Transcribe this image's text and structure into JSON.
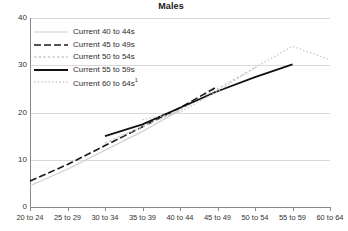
{
  "chart_data": {
    "type": "line",
    "title": "Males",
    "xlabel": "",
    "ylabel": "",
    "ylim": [
      0,
      40
    ],
    "yticks": [
      0,
      10,
      20,
      30,
      40
    ],
    "grid": true,
    "legend_position": "top-left inside plot",
    "categories": [
      "20 to 24",
      "25 to 29",
      "30 to 34",
      "35 to 39",
      "40 to 44",
      "45 to 49",
      "50 to 54",
      "55 to 59",
      "60 to 64"
    ],
    "series": [
      {
        "name": "Current 40 to 44s",
        "style": "solid",
        "color": "#cfcfcf",
        "width": 1.2,
        "x": [
          "20 to 24",
          "25 to 29",
          "30 to 34",
          "35 to 39",
          "40 to 44"
        ],
        "values": [
          4.5,
          8.0,
          12.0,
          16.0,
          20.5
        ]
      },
      {
        "name": "Current 45 to 49s",
        "style": "dashed",
        "color": "#1a1a1a",
        "width": 1.6,
        "x": [
          "20 to 24",
          "25 to 29",
          "30 to 34",
          "35 to 39",
          "40 to 44",
          "45 to 49"
        ],
        "values": [
          5.5,
          9.0,
          13.0,
          17.0,
          21.0,
          25.5
        ]
      },
      {
        "name": "Current 50 to 54s",
        "style": "dotted",
        "color": "#c9c9c9",
        "width": 1.4,
        "x": [
          "30 to 34",
          "35 to 39",
          "40 to 44",
          "45 to 49",
          "50 to 54"
        ],
        "values": [
          13.5,
          17.0,
          20.5,
          25.0,
          29.5
        ]
      },
      {
        "name": "Current 55 to 59s",
        "style": "solid",
        "color": "#111111",
        "width": 1.8,
        "x": [
          "30 to 34",
          "35 to 39",
          "40 to 44",
          "45 to 49",
          "50 to 54",
          "55 to 59"
        ],
        "values": [
          15.0,
          17.5,
          21.0,
          24.5,
          27.5,
          30.2
        ]
      },
      {
        "name": "Current 60 to 64s",
        "style": "fine-dotted",
        "color": "#c9c9c9",
        "width": 1.4,
        "x": [
          "35 to 39",
          "40 to 44",
          "45 to 49",
          "50 to 54",
          "55 to 59",
          "60 to 64"
        ],
        "values": [
          18.5,
          20.0,
          24.5,
          29.5,
          34.0,
          31.2
        ]
      }
    ]
  },
  "chart": {
    "title": "Males",
    "yticks": [
      {
        "label": "40",
        "value": 40
      },
      {
        "label": "30",
        "value": 30
      },
      {
        "label": "20",
        "value": 20
      },
      {
        "label": "10",
        "value": 10
      },
      {
        "label": "0",
        "value": 0
      }
    ],
    "xticks": [
      {
        "label": "20 to 24"
      },
      {
        "label": "25 to 29"
      },
      {
        "label": "30 to 34"
      },
      {
        "label": "35 to 39"
      },
      {
        "label": "40 to 44"
      },
      {
        "label": "45 to 49"
      },
      {
        "label": "50 to 54"
      },
      {
        "label": "55 to 59"
      },
      {
        "label": "60 to 64"
      }
    ],
    "legend": [
      {
        "label": "Current 40 to 44s",
        "sup": ""
      },
      {
        "label": "Current 45 to 49s",
        "sup": ""
      },
      {
        "label": "Current 50 to 54s",
        "sup": ""
      },
      {
        "label": "Current 55 to 59s",
        "sup": ""
      },
      {
        "label": "Current 60 to 64s",
        "sup": "1"
      }
    ]
  }
}
